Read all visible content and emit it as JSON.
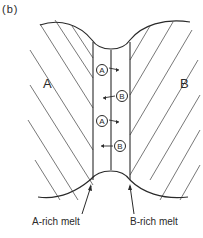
{
  "figure": {
    "panel_label": "(b)",
    "phases": {
      "left": "A",
      "right": "B"
    },
    "interface_atoms": [
      {
        "label": "A",
        "arrow_direction": "right"
      },
      {
        "label": "B",
        "arrow_direction": "left"
      },
      {
        "label": "A",
        "arrow_direction": "right"
      },
      {
        "label": "B",
        "arrow_direction": "left"
      }
    ],
    "callouts": {
      "left_melt": "A-rich melt",
      "right_melt": "B-rich melt"
    },
    "colors": {
      "line": "#2a2a2a",
      "hatch": "#555555",
      "background": "#ffffff"
    }
  }
}
